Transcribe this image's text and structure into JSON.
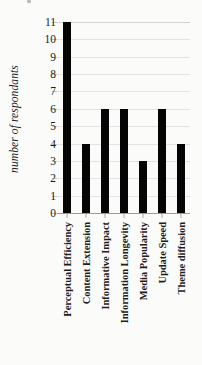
{
  "chart_data": {
    "type": "bar",
    "title": "",
    "subtitle": "",
    "xlabel": "",
    "ylabel": "number of respondants",
    "categories": [
      "Perceptual Efficiency",
      "Content Extension",
      "Informative Impact",
      "Information Longevity",
      "Media Popularity",
      "Update Speed",
      "Theme diffusion"
    ],
    "values": [
      11,
      4,
      6,
      6,
      3,
      6,
      4
    ],
    "ylim": [
      0,
      11
    ],
    "ytick_labels": [
      "11",
      "10",
      "9",
      "8",
      "7",
      "6",
      "5",
      "4",
      "3",
      "2",
      "1",
      "0"
    ],
    "ytick_values": [
      11,
      10,
      9,
      8,
      7,
      6,
      5,
      4,
      3,
      2,
      1,
      0
    ],
    "grid": true,
    "grid_axis": "y",
    "legend": false,
    "legend_position": "none",
    "bar_color": "#050505",
    "grid_color": "#e2e2e2",
    "axis_color": "#9a9a9a",
    "background_color": "#fbfbfa",
    "text_color": "#1b1b1b"
  }
}
